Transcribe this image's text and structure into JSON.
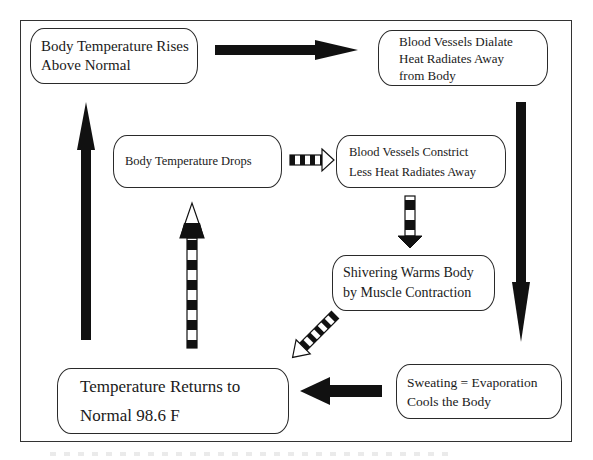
{
  "diagram": {
    "nodes": [
      {
        "id": "rises",
        "lines": [
          "Body Temperature Rises",
          "Above Normal"
        ]
      },
      {
        "id": "dilate",
        "lines": [
          "Blood  Vessels Dialate",
          "Heat Radiates Away",
          "from Body"
        ]
      },
      {
        "id": "drops",
        "lines": [
          "Body Temperature Drops"
        ]
      },
      {
        "id": "constrict",
        "lines": [
          "Blood Vessels Constrict",
          "Less Heat Radiates Away"
        ]
      },
      {
        "id": "shivering",
        "lines": [
          "Shivering Warms Body",
          "by Muscle Contraction"
        ]
      },
      {
        "id": "returns",
        "lines": [
          "Temperature Returns to",
          "Normal 98.6 F"
        ]
      },
      {
        "id": "sweating",
        "lines": [
          "Sweating = Evaporation",
          "Cools the Body"
        ]
      }
    ],
    "edges": [
      {
        "from": "rises",
        "to": "dilate",
        "style": "solid"
      },
      {
        "from": "dilate",
        "to": "sweating",
        "style": "solid"
      },
      {
        "from": "sweating",
        "to": "returns",
        "style": "solid"
      },
      {
        "from": "returns",
        "to": "rises",
        "style": "solid"
      },
      {
        "from": "drops",
        "to": "constrict",
        "style": "striped"
      },
      {
        "from": "constrict",
        "to": "shivering",
        "style": "striped"
      },
      {
        "from": "shivering",
        "to": "returns",
        "style": "striped"
      },
      {
        "from": "returns",
        "to": "drops",
        "style": "striped"
      }
    ],
    "colors": {
      "line": "#1a1a1a",
      "fill": "#ffffff"
    }
  }
}
